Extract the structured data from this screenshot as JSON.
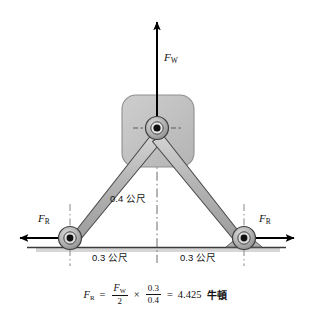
{
  "figure": {
    "colors": {
      "link_fill": "#b9b9b9",
      "link_stroke": "#4a4a4a",
      "body_fill": "#c0c0c0",
      "body_stroke": "#7a7a7a",
      "hub_outer": "#b0b0b0",
      "hub_stroke": "#3c3c3c",
      "hub_core": "#111111",
      "ground_line": "#3a3a3a",
      "ground_shadow": "#c9c9c9",
      "arrow": "#000000",
      "centerline": "#555555",
      "text": "#111111"
    }
  },
  "labels": {
    "force_up": {
      "symbol": "F",
      "subscript": "W"
    },
    "force_left": {
      "symbol": "F",
      "subscript": "R"
    },
    "force_right": {
      "symbol": "F",
      "subscript": "R"
    },
    "height_dim": "0.4 公尺",
    "half_span_left": "0.3 公尺",
    "half_span_right": "0.3 公尺"
  },
  "equation": {
    "lhs_symbol": "F",
    "lhs_subscript": "R",
    "equals": "=",
    "frac1": {
      "numerator_symbol": "F",
      "numerator_subscript": "W",
      "denominator": "2"
    },
    "times": "×",
    "frac2": {
      "numerator": "0.3",
      "denominator": "0.4"
    },
    "equals2": "=",
    "result_value": "4.425",
    "result_unit": "牛頓",
    "plain_text": "F_R = (F_W / 2) × (0.3 / 0.4) = 4.425 牛頓"
  },
  "geometry": {
    "hub_center": {
      "x": 157,
      "y": 128
    },
    "left_wheel": {
      "x": 70,
      "y": 238
    },
    "right_wheel": {
      "x": 244,
      "y": 238
    },
    "ground_y": 247,
    "fw_arrow_tip": {
      "x": 157,
      "y": 17
    },
    "fr_left_arrow_tip": {
      "x": 14,
      "y": 238
    },
    "fr_right_arrow_tip": {
      "x": 300,
      "y": 238
    }
  }
}
